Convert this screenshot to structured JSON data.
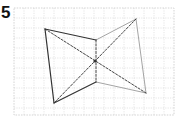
{
  "problem": {
    "number": "5"
  },
  "figure": {
    "grid": {
      "columns": 16,
      "rows": 11
    },
    "points": {
      "A": [
        3.1,
        2.1
      ],
      "B": [
        8.2,
        3.2
      ],
      "C": [
        12.2,
        1.1
      ],
      "O": [
        8.1,
        5.3
      ],
      "D": [
        8.2,
        7.4
      ],
      "E": [
        13.2,
        8.5
      ],
      "F": [
        4.0,
        9.5
      ]
    },
    "edges": [
      {
        "from": "A",
        "to": "B",
        "style": "dark"
      },
      {
        "from": "A",
        "to": "F",
        "style": "dark"
      },
      {
        "from": "F",
        "to": "D",
        "style": "dark"
      },
      {
        "from": "B",
        "to": "C",
        "style": "light"
      },
      {
        "from": "C",
        "to": "E",
        "style": "light"
      },
      {
        "from": "D",
        "to": "E",
        "style": "light"
      },
      {
        "from": "B",
        "to": "D",
        "style": "dashed"
      },
      {
        "from": "A",
        "to": "E",
        "style": "dashed"
      },
      {
        "from": "C",
        "to": "F",
        "style": "dashed"
      }
    ],
    "marked_points": [
      "O"
    ]
  }
}
